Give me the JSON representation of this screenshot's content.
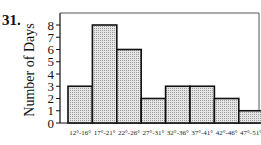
{
  "problem_number": "31.",
  "chart_data": {
    "type": "bar",
    "title": "",
    "xlabel": "",
    "ylabel": "Number of Days",
    "categories": [
      "12°-16°",
      "17°-21°",
      "22°-26°",
      "27°-31°",
      "32°-36°",
      "37°-41°",
      "42°-46°",
      "47°-51°"
    ],
    "values": [
      3,
      8,
      6,
      2,
      3,
      3,
      2,
      1
    ],
    "ylim": [
      0,
      8
    ],
    "yticks": [
      0,
      1,
      2,
      3,
      4,
      5,
      6,
      7,
      8
    ],
    "grid": false,
    "legend": "none",
    "histogram": true,
    "bar_fill": "#d9d9d9",
    "bar_stroke": "#111111"
  }
}
